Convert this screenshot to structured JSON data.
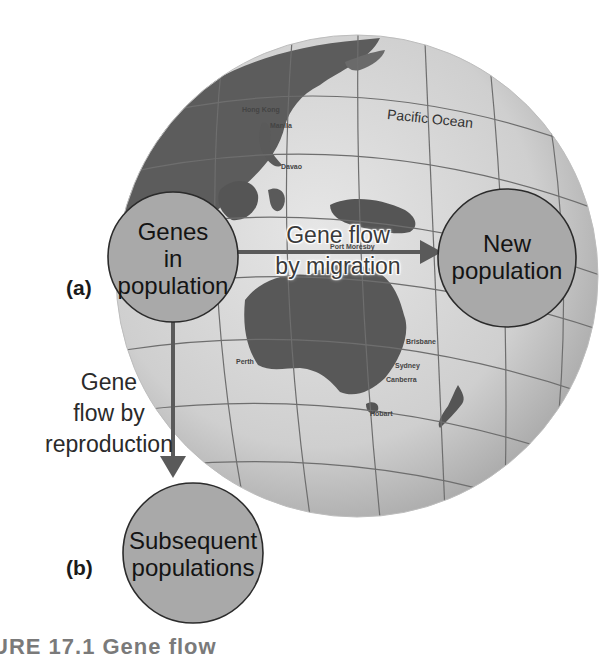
{
  "figure": {
    "caption_partial": "URE 17.1  Gene flow",
    "panels": [
      {
        "id": "a",
        "label": "(a)"
      },
      {
        "id": "b",
        "label": "(b)"
      }
    ]
  },
  "globe": {
    "ocean_label": "Pacific Ocean",
    "place_labels": [
      "Hong Kong",
      "Manila",
      "Davao",
      "Port Moresby",
      "Darwin",
      "Brisbane",
      "Perth",
      "Sydney",
      "Canberra",
      "Melbourne",
      "Hobart",
      "Auckland",
      "Wellington",
      "Indonesia",
      "Philippines"
    ],
    "colors": {
      "ocean": "#d4d4d4",
      "land": "#5f5f5f",
      "grid": "#6e6e6e"
    }
  },
  "nodes": {
    "source": {
      "lines": [
        "Genes",
        "in",
        "population"
      ]
    },
    "new_population": {
      "lines": [
        "New",
        "population"
      ]
    },
    "subsequent": {
      "lines": [
        "Subsequent",
        "populations"
      ]
    },
    "fill": "#a9a9a9",
    "stroke": "#2b2b2b"
  },
  "arrows": {
    "migration": {
      "lines": [
        "Gene flow",
        "by migration"
      ]
    },
    "reproduction": {
      "lines": [
        "Gene",
        "flow by",
        "reproduction"
      ]
    },
    "color": "#5a5a5a"
  }
}
